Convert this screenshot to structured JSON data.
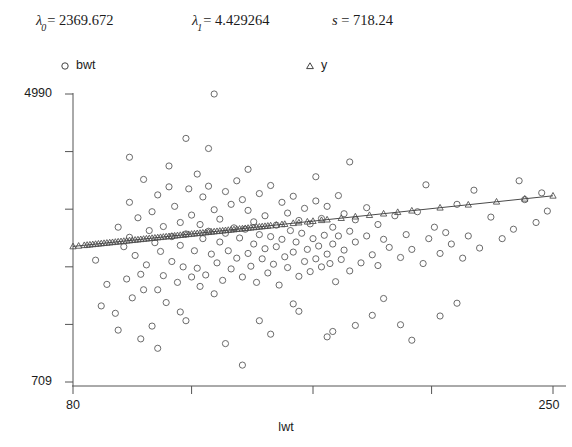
{
  "header": {
    "params": [
      {
        "name": "lambda-0",
        "symbol": "λ",
        "subscript": "0",
        "eq": "=",
        "value": "2369.672"
      },
      {
        "name": "lambda-1",
        "symbol": "λ",
        "subscript": "1",
        "eq": "=",
        "value": "4.429264"
      },
      {
        "name": "s",
        "symbol": "s",
        "subscript": "",
        "eq": "=",
        "value": "718.24"
      }
    ]
  },
  "legend": {
    "position": "top",
    "entries": [
      {
        "label": "bwt",
        "marker": "circle-marker-icon",
        "color": "#444444"
      },
      {
        "label": "y",
        "marker": "triangle-marker-icon",
        "color": "#444444"
      }
    ]
  },
  "chart_data": {
    "type": "scatter",
    "title": "",
    "xlabel": "lwt",
    "ylabel": "",
    "xlim": [
      80,
      250
    ],
    "ylim": [
      709,
      4990
    ],
    "xticklabels": [
      "80",
      "250"
    ],
    "yticklabels": [
      "4990",
      "709"
    ],
    "xticks": [
      80,
      122,
      165,
      207,
      250
    ],
    "yticks": [
      709,
      1565,
      2421,
      3278,
      4134,
      4990
    ],
    "grid": false,
    "axis_color": "#555555",
    "series": [
      {
        "name": "bwt",
        "marker": "circle",
        "color": "#5a5a5a",
        "points": [
          [
            88,
            2520
          ],
          [
            92,
            2160
          ],
          [
            95,
            1730
          ],
          [
            96,
            3010
          ],
          [
            98,
            2720
          ],
          [
            99,
            2240
          ],
          [
            100,
            2860
          ],
          [
            100,
            3380
          ],
          [
            101,
            1960
          ],
          [
            102,
            2590
          ],
          [
            103,
            3150
          ],
          [
            104,
            2310
          ],
          [
            105,
            3720
          ],
          [
            105,
            2080
          ],
          [
            106,
            2450
          ],
          [
            107,
            2960
          ],
          [
            108,
            1540
          ],
          [
            108,
            3240
          ],
          [
            109,
            2780
          ],
          [
            110,
            2080
          ],
          [
            110,
            3490
          ],
          [
            111,
            2650
          ],
          [
            112,
            3020
          ],
          [
            112,
            2290
          ],
          [
            113,
            1890
          ],
          [
            114,
            3610
          ],
          [
            115,
            2500
          ],
          [
            115,
            2870
          ],
          [
            116,
            3320
          ],
          [
            117,
            2190
          ],
          [
            118,
            2740
          ],
          [
            118,
            3080
          ],
          [
            119,
            2420
          ],
          [
            120,
            4330
          ],
          [
            120,
            2910
          ],
          [
            121,
            3580
          ],
          [
            122,
            2270
          ],
          [
            122,
            3190
          ],
          [
            123,
            2660
          ],
          [
            124,
            3800
          ],
          [
            124,
            2400
          ],
          [
            125,
            3050
          ],
          [
            125,
            2130
          ],
          [
            126,
            3460
          ],
          [
            126,
            2840
          ],
          [
            127,
            2300
          ],
          [
            128,
            3620
          ],
          [
            128,
            2950
          ],
          [
            129,
            2610
          ],
          [
            130,
            4990
          ],
          [
            130,
            3270
          ],
          [
            131,
            2480
          ],
          [
            132,
            3130
          ],
          [
            132,
            2790
          ],
          [
            133,
            2220
          ],
          [
            134,
            3540
          ],
          [
            134,
            2920
          ],
          [
            135,
            2660
          ],
          [
            136,
            3350
          ],
          [
            136,
            2390
          ],
          [
            137,
            3000
          ],
          [
            138,
            2550
          ],
          [
            138,
            3700
          ],
          [
            139,
            2850
          ],
          [
            140,
            2270
          ],
          [
            140,
            3420
          ],
          [
            141,
            2980
          ],
          [
            142,
            2620
          ],
          [
            142,
            3260
          ],
          [
            143,
            2430
          ],
          [
            144,
            3090
          ],
          [
            144,
            2760
          ],
          [
            145,
            2190
          ],
          [
            146,
            3510
          ],
          [
            146,
            2900
          ],
          [
            147,
            2540
          ],
          [
            148,
            3180
          ],
          [
            148,
            2690
          ],
          [
            149,
            2330
          ],
          [
            150,
            3630
          ],
          [
            150,
            2870
          ],
          [
            151,
            2460
          ],
          [
            152,
            3040
          ],
          [
            152,
            2720
          ],
          [
            153,
            2150
          ],
          [
            154,
            3380
          ],
          [
            154,
            2830
          ],
          [
            155,
            2570
          ],
          [
            156,
            3220
          ],
          [
            156,
            2410
          ],
          [
            157,
            2960
          ],
          [
            158,
            2640
          ],
          [
            158,
            3470
          ],
          [
            159,
            2790
          ],
          [
            160,
            2280
          ],
          [
            160,
            3110
          ],
          [
            161,
            2920
          ],
          [
            162,
            2500
          ],
          [
            162,
            3290
          ],
          [
            163,
            2680
          ],
          [
            164,
            3060
          ],
          [
            164,
            2350
          ],
          [
            165,
            2840
          ],
          [
            166,
            2540
          ],
          [
            166,
            3400
          ],
          [
            167,
            2730
          ],
          [
            168,
            3140
          ],
          [
            168,
            2420
          ],
          [
            169,
            2890
          ],
          [
            170,
            2610
          ],
          [
            170,
            3320
          ],
          [
            171,
            2470
          ],
          [
            172,
            3010
          ],
          [
            172,
            2760
          ],
          [
            173,
            2200
          ],
          [
            174,
            3480
          ],
          [
            174,
            2880
          ],
          [
            175,
            2530
          ],
          [
            176,
            3210
          ],
          [
            176,
            2670
          ],
          [
            178,
            2950
          ],
          [
            178,
            2360
          ],
          [
            180,
            3120
          ],
          [
            180,
            2790
          ],
          [
            182,
            2480
          ],
          [
            184,
            3300
          ],
          [
            184,
            2880
          ],
          [
            186,
            2600
          ],
          [
            188,
            3050
          ],
          [
            188,
            2440
          ],
          [
            190,
            2830
          ],
          [
            192,
            2710
          ],
          [
            194,
            3180
          ],
          [
            196,
            2560
          ],
          [
            198,
            2900
          ],
          [
            200,
            2680
          ],
          [
            202,
            3240
          ],
          [
            204,
            2470
          ],
          [
            206,
            2840
          ],
          [
            208,
            3010
          ],
          [
            210,
            2620
          ],
          [
            212,
            2930
          ],
          [
            214,
            2760
          ],
          [
            216,
            3350
          ],
          [
            218,
            2550
          ],
          [
            220,
            2880
          ],
          [
            224,
            2700
          ],
          [
            228,
            3160
          ],
          [
            232,
            2840
          ],
          [
            236,
            2980
          ],
          [
            240,
            3420
          ],
          [
            244,
            3080
          ],
          [
            248,
            3250
          ],
          [
            110,
            1210
          ],
          [
            140,
            960
          ],
          [
            150,
            1420
          ],
          [
            170,
            1380
          ],
          [
            200,
            1330
          ],
          [
            210,
            1690
          ],
          [
            90,
            1840
          ],
          [
            120,
            1620
          ],
          [
            130,
            2020
          ],
          [
            160,
            1760
          ],
          [
            180,
            1550
          ],
          [
            190,
            1950
          ],
          [
            100,
            4050
          ],
          [
            114,
            3920
          ],
          [
            128,
            4180
          ],
          [
            142,
            3870
          ],
          [
            166,
            3760
          ],
          [
            178,
            3980
          ],
          [
            205,
            3640
          ],
          [
            222,
            3560
          ],
          [
            238,
            3700
          ],
          [
            246,
            3520
          ],
          [
            96,
            1480
          ],
          [
            104,
            1350
          ],
          [
            118,
            1750
          ],
          [
            134,
            1280
          ],
          [
            146,
            1620
          ],
          [
            158,
            1870
          ],
          [
            172,
            1460
          ],
          [
            186,
            1700
          ],
          [
            196,
            1560
          ],
          [
            216,
            1880
          ]
        ]
      },
      {
        "name": "y",
        "marker": "triangle",
        "color": "#4a4a4a",
        "line": true,
        "slope": 4.429264,
        "intercept": 2369.672,
        "x_values": [
          80,
          82,
          84,
          85,
          86,
          87,
          88,
          89,
          90,
          91,
          92,
          93,
          94,
          95,
          96,
          97,
          98,
          99,
          100,
          101,
          102,
          103,
          104,
          105,
          106,
          107,
          108,
          109,
          110,
          111,
          112,
          113,
          114,
          115,
          116,
          117,
          118,
          119,
          120,
          121,
          122,
          123,
          124,
          125,
          126,
          127,
          128,
          129,
          130,
          131,
          132,
          133,
          134,
          135,
          136,
          137,
          138,
          139,
          140,
          141,
          142,
          143,
          144,
          145,
          146,
          147,
          148,
          149,
          150,
          152,
          154,
          155,
          158,
          160,
          163,
          165,
          168,
          170,
          175,
          180,
          185,
          190,
          195,
          200,
          210,
          220,
          230,
          240,
          250
        ]
      }
    ]
  }
}
